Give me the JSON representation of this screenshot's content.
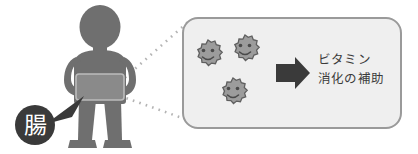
{
  "figure": {
    "background_color": "#ffffff"
  },
  "person": {
    "name": "standing-person-pictogram",
    "body_color": "#6f6f6f",
    "abdomen_highlight_color": "#8a8a8a",
    "abdomen_highlight_border": "#b9b9b9"
  },
  "callout": {
    "badge_label": "腸",
    "badge_fill": "#3a3a3a",
    "badge_text_color": "#ffffff",
    "pointer_color": "#3a3a3a"
  },
  "connector": {
    "name": "dotted-zoom-connector",
    "dot_color": "#b4b4b4",
    "upper_line": "belly-to-panel-top-left",
    "lower_line": "belly-to-panel-bottom-left"
  },
  "panel": {
    "fill": "#efefef",
    "border": "#9a9a9a",
    "corner_radius": 14
  },
  "microbes": [
    {
      "label": "smiling-microbe-1",
      "cx": 208,
      "cy": 54,
      "r": 14
    },
    {
      "label": "smiling-microbe-2",
      "cx": 245,
      "cy": 49,
      "r": 14
    },
    {
      "label": "smiling-microbe-3",
      "cx": 233,
      "cy": 92,
      "r": 14
    }
  ],
  "microbe_style": {
    "body_fill": "#9c9c9c",
    "outline": "#5f5f5f",
    "face_color": "#4a4a4a"
  },
  "arrow": {
    "name": "right-block-arrow",
    "color": "#3a3a3a"
  },
  "benefits": {
    "line1": "ビタミン",
    "line2": "消化の補助",
    "text_color": "#3b3b3b"
  }
}
